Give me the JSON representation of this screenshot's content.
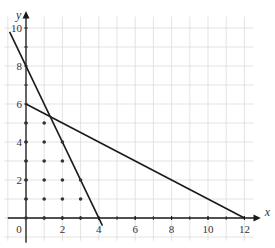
{
  "chart_data": {
    "type": "line",
    "title": "",
    "xlabel": "x",
    "ylabel": "y",
    "xlim": [
      -1,
      12.5
    ],
    "ylim": [
      -1,
      10.8
    ],
    "grid": true,
    "x_ticks": [
      0,
      2,
      4,
      6,
      8,
      10,
      12
    ],
    "y_ticks": [
      2,
      4,
      6,
      8,
      10
    ],
    "x_tick_labels": [
      "0",
      "2",
      "4",
      "6",
      "8",
      "10",
      "12"
    ],
    "y_tick_labels": [
      "2",
      "4",
      "6",
      "8",
      "10"
    ],
    "series": [
      {
        "name": "2x + y = 8",
        "points": [
          [
            -0.9,
            9.8
          ],
          [
            4.2,
            -0.4
          ]
        ]
      },
      {
        "name": "x + 2y = 12",
        "points": [
          [
            0,
            6
          ],
          [
            12,
            0
          ]
        ]
      }
    ],
    "lattice_points": [
      [
        0,
        0
      ],
      [
        0,
        1
      ],
      [
        0,
        2
      ],
      [
        0,
        3
      ],
      [
        0,
        4
      ],
      [
        0,
        5
      ],
      [
        1,
        0
      ],
      [
        1,
        1
      ],
      [
        1,
        2
      ],
      [
        1,
        3
      ],
      [
        1,
        4
      ],
      [
        1,
        5
      ],
      [
        2,
        0
      ],
      [
        2,
        1
      ],
      [
        2,
        2
      ],
      [
        2,
        3
      ],
      [
        2,
        4
      ],
      [
        3,
        0
      ],
      [
        3,
        1
      ],
      [
        3,
        2
      ]
    ],
    "colors": {
      "line": "#1a1a1a",
      "grid": "#dcdcdc",
      "point": "#333333"
    }
  }
}
